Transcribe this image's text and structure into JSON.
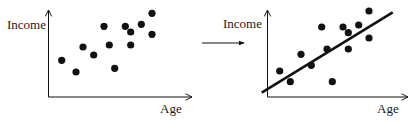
{
  "figure": {
    "colors": {
      "ink": "#111111",
      "background": "#ffffff"
    }
  },
  "left_plot": {
    "ylabel": "Income",
    "xlabel": "Age",
    "points": [
      [
        61.7,
        60.3
      ],
      [
        76,
        72
      ],
      [
        83,
        47
      ],
      [
        93.7,
        55
      ],
      [
        104,
        26.3
      ],
      [
        109.3,
        45
      ],
      [
        114.7,
        68.3
      ],
      [
        125.3,
        26.3
      ],
      [
        130.7,
        32
      ],
      [
        130.7,
        45
      ],
      [
        141.3,
        24.3
      ],
      [
        152,
        13.3
      ],
      [
        152,
        34.3
      ]
    ]
  },
  "transition_arrow": {
    "icon": "right-arrow-icon"
  },
  "right_plot": {
    "ylabel": "Income",
    "xlabel": "Age",
    "regression_line": {
      "x1": 261.7,
      "y1": 92.7,
      "x2": 392.7,
      "y2": 12.3
    },
    "points": [
      [
        279.7,
        71
      ],
      [
        290.3,
        81.7
      ],
      [
        301,
        54.3
      ],
      [
        311.3,
        65.3
      ],
      [
        321.7,
        27
      ],
      [
        327,
        49
      ],
      [
        332.3,
        81.7
      ],
      [
        343,
        27
      ],
      [
        348.3,
        32.7
      ],
      [
        348.3,
        49
      ],
      [
        358.7,
        25
      ],
      [
        369,
        11
      ],
      [
        369,
        38
      ]
    ]
  },
  "chart_data": [
    {
      "type": "scatter",
      "title": "",
      "xlabel": "Age",
      "ylabel": "Income",
      "grid": false,
      "ticks": "none",
      "note": "relative positions (0-100 scale), no numeric axes shown",
      "x": [
        10,
        20,
        24,
        32,
        39,
        43,
        46,
        54,
        58,
        58,
        65,
        72,
        72
      ],
      "y": [
        43,
        29,
        58,
        48,
        81,
        60,
        33,
        81,
        74,
        60,
        83,
        96,
        72
      ]
    },
    {
      "type": "scatter",
      "title": "",
      "xlabel": "Age",
      "ylabel": "Income",
      "grid": false,
      "ticks": "none",
      "note": "same data with fitted linear regression line",
      "x": [
        9,
        16,
        24,
        31,
        38,
        42,
        46,
        53,
        57,
        57,
        64,
        72,
        72
      ],
      "y": [
        30,
        18,
        49,
        36,
        80,
        55,
        18,
        80,
        74,
        55,
        83,
        99,
        68
      ],
      "fit_line": {
        "type": "linear",
        "from": [
          -4,
          5
        ],
        "to": [
          88,
          97
        ]
      }
    }
  ]
}
